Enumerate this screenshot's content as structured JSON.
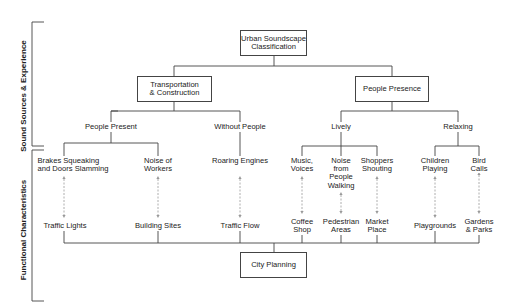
{
  "diagram": {
    "root": "Urban Soundscape\nClassification",
    "level1": [
      {
        "id": "transport",
        "label": "Transportation\n& Construction"
      },
      {
        "id": "people",
        "label": "People Presence"
      }
    ],
    "level2": [
      {
        "id": "people-present",
        "label": "People Present"
      },
      {
        "id": "without-people",
        "label": "Without People"
      },
      {
        "id": "lively",
        "label": "Lively"
      },
      {
        "id": "relaxing",
        "label": "Relaxing"
      }
    ],
    "sources": [
      {
        "label": "Brakes Squeaking\nand Doors Slamming"
      },
      {
        "label": "Noise of\nWorkers"
      },
      {
        "label": "Roaring Engines"
      },
      {
        "label": "Music,\nVoices"
      },
      {
        "label": "Noise\nfrom\nPeople\nWalking"
      },
      {
        "label": "Shoppers\nShouting"
      },
      {
        "label": "Children\nPlaying"
      },
      {
        "label": "Bird Calls"
      }
    ],
    "functions": [
      {
        "label": "Traffic Lights"
      },
      {
        "label": "Building Sites"
      },
      {
        "label": "Traffic Flow"
      },
      {
        "label": "Coffee\nShop"
      },
      {
        "label": "Pedestrian\nAreas"
      },
      {
        "label": "Market\nPlace"
      },
      {
        "label": "Playgrounds"
      },
      {
        "label": "Gardens\n& Parks"
      }
    ],
    "bottom": "City Planning",
    "side_labels": {
      "top": "Sound Sources & Experience",
      "bottom": "Functional Characteristics"
    },
    "colors": {
      "line": "#444444",
      "dashed": "#999999"
    }
  }
}
